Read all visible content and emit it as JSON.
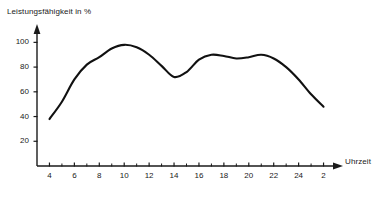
{
  "chart_data": {
    "type": "line",
    "title": "",
    "xlabel": "Uhrzeit",
    "ylabel": "Leistungsfähigkeit in %",
    "ylim": [
      0,
      110
    ],
    "xlim": [
      3,
      27
    ],
    "grid": false,
    "legend": null,
    "y_ticks": [
      20,
      40,
      60,
      80,
      100
    ],
    "x_ticks": [
      4,
      6,
      8,
      10,
      12,
      14,
      16,
      18,
      20,
      22,
      24,
      2
    ],
    "x_tick_values": [
      4,
      6,
      8,
      10,
      12,
      14,
      16,
      18,
      20,
      22,
      24,
      26
    ],
    "x_minor_step": 1,
    "series": [
      {
        "name": "Leistungsfähigkeit",
        "x": [
          4,
          5,
          6,
          7,
          8,
          9,
          10,
          11,
          12,
          13,
          14,
          15,
          16,
          17,
          18,
          19,
          20,
          21,
          22,
          23,
          24,
          25,
          26
        ],
        "values": [
          38,
          52,
          70,
          82,
          88,
          95,
          98,
          96,
          90,
          81,
          72,
          76,
          86,
          90,
          89,
          87,
          88,
          90,
          87,
          80,
          70,
          58,
          48
        ]
      }
    ],
    "annotations": {
      "peak_value": 98,
      "peak_time": 10,
      "dip_value": 72,
      "dip_time": 14,
      "start_value": 38,
      "end_value": 37
    },
    "line_color": "#111111",
    "axis_color": "#1a1a1a"
  }
}
